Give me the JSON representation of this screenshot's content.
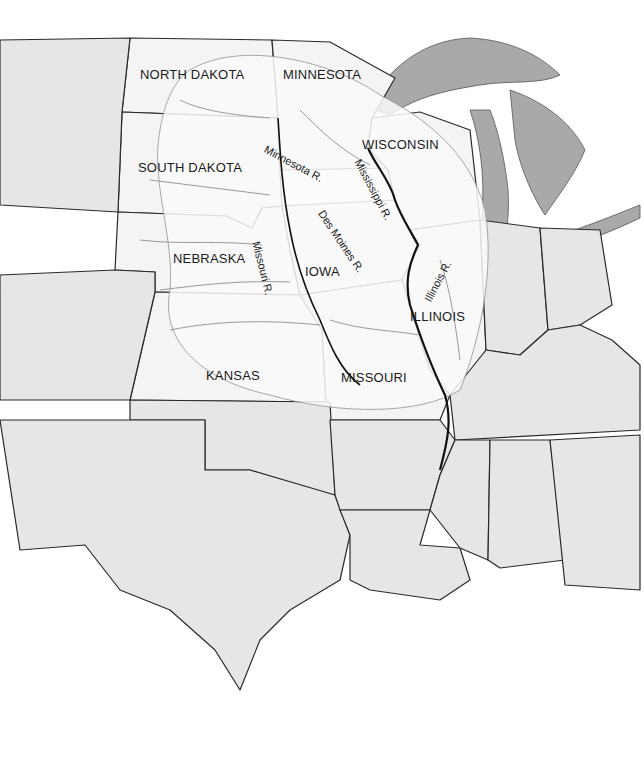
{
  "map": {
    "title": "Upper Mississippi River Basin",
    "state_labels": [
      {
        "id": "north-dakota",
        "text": "NORTH DAKOTA",
        "x": 140,
        "y": 67
      },
      {
        "id": "minnesota",
        "text": "MINNESOTA",
        "x": 283,
        "y": 67
      },
      {
        "id": "wisconsin",
        "text": "WISCONSIN",
        "x": 362,
        "y": 137
      },
      {
        "id": "south-dakota",
        "text": "SOUTH DAKOTA",
        "x": 138,
        "y": 160
      },
      {
        "id": "nebraska",
        "text": "NEBRASKA",
        "x": 173,
        "y": 251
      },
      {
        "id": "iowa",
        "text": "IOWA",
        "x": 305,
        "y": 264
      },
      {
        "id": "illinois",
        "text": "ILLINOIS",
        "x": 410,
        "y": 309
      },
      {
        "id": "kansas",
        "text": "KANSAS",
        "x": 206,
        "y": 368
      },
      {
        "id": "missouri",
        "text": "MISSOURI",
        "x": 341,
        "y": 370
      }
    ],
    "river_labels": [
      {
        "id": "minnesota-river",
        "text": "Minnesota R.",
        "x": 268,
        "y": 143,
        "rotate": 28
      },
      {
        "id": "mississippi-river",
        "text": "Mississippi R.",
        "x": 363,
        "y": 157,
        "rotate": 62
      },
      {
        "id": "des-moines-river",
        "text": "Des Moines R.",
        "x": 326,
        "y": 208,
        "rotate": 56
      },
      {
        "id": "missouri-river",
        "text": "Missouri R.",
        "x": 262,
        "y": 240,
        "rotate": 76
      },
      {
        "id": "illinois-river",
        "text": "Illinois R.",
        "x": 422,
        "y": 298,
        "rotate": -62
      }
    ],
    "colors": {
      "land": "#e6e6e6",
      "basin": "#fbfbfb",
      "lakes": "#a9a9a9",
      "borders": "#2a2a2a",
      "rivers": "#9a9a9a"
    }
  }
}
